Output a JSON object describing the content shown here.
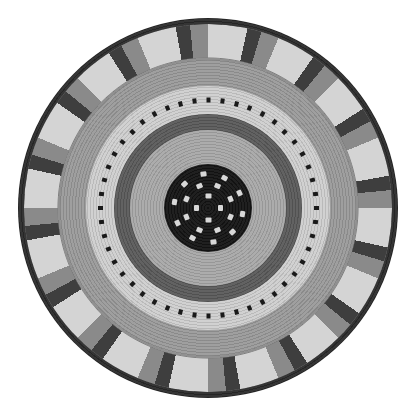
{
  "image": {
    "subject": "Woven coiled basket viewed from above",
    "palette": {
      "rim": "#2a2a2a",
      "outer_band": "#8a8a8a",
      "chevron_light": "#d4d4d4",
      "chevron_dark": "#3e3e3e",
      "mid_gray": "#9a9a9a",
      "light_band": "#cfcfcf",
      "dark_band": "#5a5a5a",
      "inner_gray": "#a8a8a8",
      "center": "#141414",
      "background": "#ffffff"
    },
    "rings": [
      {
        "name": "rim",
        "radius": 190
      },
      {
        "name": "chevron-band",
        "radius": 184
      },
      {
        "name": "outer-gray-band",
        "radius": 148
      },
      {
        "name": "light-dotted-band",
        "radius": 122
      },
      {
        "name": "dark-band",
        "radius": 94
      },
      {
        "name": "inner-gray-band",
        "radius": 78
      },
      {
        "name": "center-disc",
        "radius": 44
      }
    ],
    "chevron_count": 16,
    "dot_ring_radius": 108,
    "dot_count": 48,
    "center_dot_count": 22
  }
}
